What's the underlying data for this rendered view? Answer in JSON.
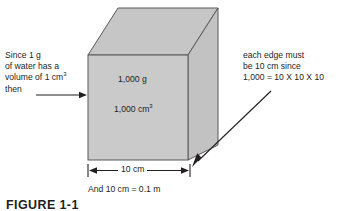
{
  "figure": {
    "caption": "FIGURE 1-1",
    "notes": {
      "left": {
        "line1": "Since 1 g",
        "line2": "of water has a",
        "line3_prefix": "volume of 1 cm",
        "line3_sup": "3",
        "line4": "then"
      },
      "right": {
        "line1": "each edge must",
        "line2": "be 10 cm since",
        "line3": "1,000 = 10 X 10 X 10"
      }
    },
    "cube": {
      "mass_label": "1,000 g",
      "volume_label_prefix": "1,000 cm",
      "volume_label_sup": "3",
      "fill_color": "#c9c9c9",
      "top_face_color": "#c4c4c4",
      "right_face_color": "#c0c0c0",
      "stroke_color": "#595959"
    },
    "dimension": {
      "width_label": "10 cm",
      "conversion_note": "And 10 cm = 0.1 m"
    },
    "arrows": {
      "left_arrow_name": "arrow-pointing-to-cube",
      "right_arrow_name": "arrow-pointing-to-edge"
    }
  }
}
